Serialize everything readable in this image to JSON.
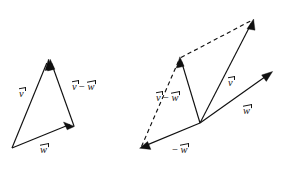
{
  "figure": {
    "background_color": "#ffffff",
    "stroke_color": "#101010",
    "width": 283,
    "height": 170
  },
  "labels": {
    "left_v": {
      "head": "v",
      "op": "",
      "tail": ""
    },
    "left_v_minus_w": {
      "head": "v",
      "op": "−",
      "tail": "w"
    },
    "left_w": {
      "head": "w",
      "op": "",
      "tail": ""
    },
    "right_v_minus_w": {
      "head": "v",
      "op": "−",
      "tail": "w"
    },
    "right_v": {
      "head": "v",
      "op": "",
      "tail": ""
    },
    "right_w": {
      "head": "w",
      "op": "",
      "tail": ""
    },
    "right_neg_w": {
      "head": "w",
      "op": "−",
      "tail": ""
    }
  },
  "label_text": {
    "v": "v",
    "w": "w",
    "minus": "−",
    "v_minus_w": "v − w",
    "neg_w": "− w"
  },
  "diagrams": [
    {
      "name": "triangle-diagram",
      "description": "Triangle showing v, w and v minus w as the closing side",
      "vectors": [
        {
          "name": "v",
          "label": "v",
          "from": [
            12,
            148
          ],
          "to": [
            48,
            60
          ],
          "style": "solid",
          "arrow": true
        },
        {
          "name": "w",
          "label": "w",
          "from": [
            12,
            148
          ],
          "to": [
            74,
            126
          ],
          "style": "solid",
          "arrow": true
        },
        {
          "name": "v-minus-w",
          "label": "v − w",
          "from": [
            74,
            126
          ],
          "to": [
            50,
            60
          ],
          "style": "solid",
          "arrow": true
        }
      ]
    },
    {
      "name": "parallelogram-diagram",
      "description": "Parallelogram showing v plus negative w equals v minus w",
      "vectors": [
        {
          "name": "v",
          "label": "v",
          "from": [
            200,
            123
          ],
          "to": [
            253,
            20
          ],
          "style": "solid",
          "arrow": true
        },
        {
          "name": "w",
          "label": "w",
          "from": [
            200,
            123
          ],
          "to": [
            272,
            72
          ],
          "style": "solid",
          "arrow": true
        },
        {
          "name": "neg-w",
          "label": "− w",
          "from": [
            200,
            123
          ],
          "to": [
            140,
            148
          ],
          "style": "solid",
          "arrow": true
        },
        {
          "name": "v-minus-w",
          "label": "v − w",
          "from": [
            200,
            123
          ],
          "to": [
            180,
            57
          ],
          "style": "solid",
          "arrow": true
        },
        {
          "name": "diagonal-dashed",
          "label": "",
          "from": [
            180,
            57
          ],
          "to": [
            252,
            19
          ],
          "style": "dashed",
          "arrow": false
        },
        {
          "name": "side-dashed",
          "label": "",
          "from": [
            140,
            148
          ],
          "to": [
            179,
            58
          ],
          "style": "dashed",
          "arrow": false
        }
      ]
    }
  ]
}
